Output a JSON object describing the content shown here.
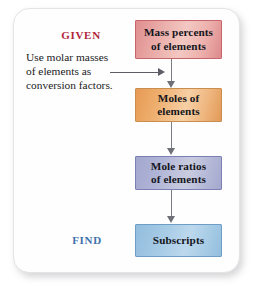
{
  "figure": {
    "type": "flowchart",
    "orientation": "vertical",
    "background_color": "#ffffff",
    "card_color": "#fefeff"
  },
  "labels": {
    "given": "GIVEN",
    "given_color": "#b2253a",
    "find": "FIND",
    "find_color": "#3f72ab"
  },
  "note": {
    "line1": "Use molar masses",
    "line2": "of elements as",
    "line3": "conversion factors."
  },
  "boxes": [
    {
      "id": "mass-percents",
      "line1": "Mass percents",
      "line2": "of elements",
      "fill_color": "#f0b8b3",
      "border_color": "#c9646a"
    },
    {
      "id": "moles",
      "line1": "Moles of",
      "line2": "elements",
      "fill_color": "#f0b275",
      "border_color": "#c98d4e"
    },
    {
      "id": "mole-ratios",
      "line1": "Mole ratios",
      "line2": "of elements",
      "fill_color": "#b6bada",
      "border_color": "#7b80b4"
    },
    {
      "id": "subscripts",
      "line1": "Subscripts",
      "line2": "",
      "fill_color": "#a8cce6",
      "border_color": "#6e9dc6"
    }
  ],
  "connectors": {
    "arrow_color": "#6f6f78",
    "count": 4
  }
}
